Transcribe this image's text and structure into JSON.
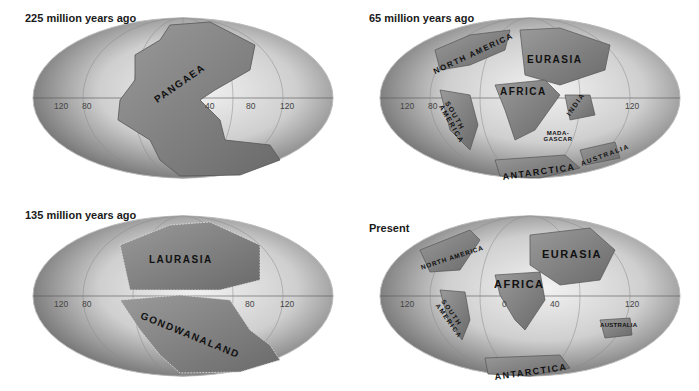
{
  "panels": [
    {
      "title": "225 million years ago",
      "ticks": [
        "120",
        "80",
        "40",
        "80",
        "120"
      ],
      "labels": [
        "PANGAEA"
      ]
    },
    {
      "title": "65 million years ago",
      "ticks": [
        "120",
        "80",
        "120"
      ],
      "labels": [
        "NORTH AMERICA",
        "EURASIA",
        "AFRICA",
        "SOUTH AMERICA",
        "INDIA",
        "MADA-GASCAR",
        "AUSTRALIA",
        "ANTARCTICA"
      ]
    },
    {
      "title": "135 million years ago",
      "ticks": [
        "120",
        "80",
        "80",
        "120"
      ],
      "labels": [
        "LAURASIA",
        "GONDWANALAND"
      ]
    },
    {
      "title": "Present",
      "ticks": [
        "120",
        "0",
        "40",
        "120"
      ],
      "labels": [
        "NORTH AMERICA",
        "EURASIA",
        "AFRICA",
        "SOUTH AMERICA",
        "AUSTRALIA",
        "ANTARCTICA"
      ]
    }
  ]
}
